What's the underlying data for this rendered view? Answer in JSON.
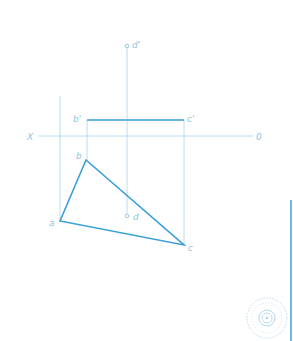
{
  "diagram": {
    "title": "",
    "colors": {
      "thin_line": "#a9d3ea",
      "thick_line": "#3a9fd6",
      "label": "#8fc3e0",
      "edge_bar": "#4aa8dc"
    },
    "axis": {
      "left_label": "X",
      "right_label": "0"
    },
    "labels": {
      "d_prime": "d'",
      "b_prime": "b'",
      "c_prime": "c'",
      "b": "b",
      "a": "a",
      "c": "c",
      "d": "d"
    },
    "points": {
      "d_prime": [
        127,
        46
      ],
      "b_prime": [
        87,
        120
      ],
      "c_prime": [
        184,
        120
      ],
      "a": [
        60,
        221
      ],
      "b": [
        86,
        160
      ],
      "c": [
        184,
        245
      ],
      "d": [
        127,
        216
      ]
    },
    "watermark": "seal-logo"
  }
}
